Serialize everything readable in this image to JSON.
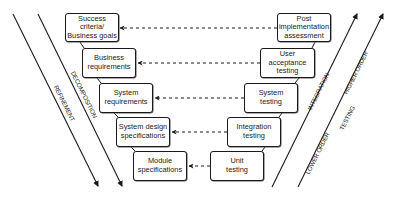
{
  "diagram": {
    "type": "V-model",
    "left_boxes": [
      {
        "label": "Success criteria/\nBusiness goals"
      },
      {
        "label": "Business\nrequirements"
      },
      {
        "label": "System\nrequirements"
      },
      {
        "label": "System design\nspecifications"
      },
      {
        "label": "Module\nspecifications"
      }
    ],
    "right_boxes": [
      {
        "label": "Post\nimplementation\nassessment"
      },
      {
        "label": "User acceptance\ntesting"
      },
      {
        "label": "System\ntesting"
      },
      {
        "label": "Integration\ntesting"
      },
      {
        "label": "Unit\ntesting"
      }
    ],
    "axis_labels": {
      "refinement": "REFINEMENT",
      "decomposition": "DECOMPOSITION",
      "integration": "INTEGRATION",
      "higher_order": "HIGHER ORDER",
      "lower_order": "LOWER ORDER",
      "testing": "TESTING"
    },
    "connections": [
      {
        "from": "Post implementation assessment",
        "to": "Success criteria/Business goals",
        "style": "dashed-arrow"
      },
      {
        "from": "User acceptance testing",
        "to": "Business requirements",
        "style": "dashed-arrow"
      },
      {
        "from": "System testing",
        "to": "System requirements",
        "style": "dashed-arrow"
      },
      {
        "from": "Integration testing",
        "to": "System design specifications",
        "style": "dashed-arrow"
      },
      {
        "from": "Unit testing",
        "to": "Module specifications",
        "style": "dashed-arrow"
      }
    ],
    "colors": {
      "line": "#1a1a1a",
      "background": "#ffffff"
    }
  }
}
